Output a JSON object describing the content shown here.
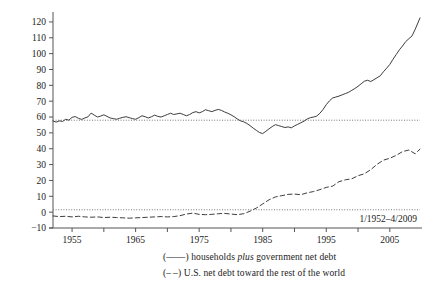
{
  "chart_data": {
    "type": "line",
    "title": "",
    "xlabel": "",
    "ylabel": "",
    "xlim": [
      1952.0,
      2009.75
    ],
    "ylim": [
      -10,
      125
    ],
    "ytick_labels": [
      "120",
      "110",
      "100",
      "90",
      "80",
      "70",
      "60",
      "50",
      "40",
      "30",
      "20",
      "10",
      "0",
      "-10"
    ],
    "ytick_values": [
      120,
      110,
      100,
      90,
      80,
      70,
      60,
      50,
      40,
      30,
      20,
      10,
      0,
      -10
    ],
    "xtick_labels": [
      "1955",
      "1965",
      "1975",
      "1985",
      "1995",
      "2005"
    ],
    "xtick_values": [
      1955,
      1965,
      1975,
      1985,
      1995,
      2005
    ],
    "xminor_ticks": [
      1960,
      1970,
      1980,
      1990,
      2000
    ],
    "grid": false,
    "legend_position": "below-right",
    "reference_lines": [
      {
        "name": "households-plus-government-mean",
        "value": 58,
        "style": "dotted"
      },
      {
        "name": "us-net-debt-mean",
        "value": 1.5,
        "style": "dotted"
      }
    ],
    "annotation": "1/1952–4/2009",
    "series": [
      {
        "name": "households plus government net debt",
        "style": "solid",
        "color": "#333333",
        "x": [
          1952.0,
          1952.5,
          1953.0,
          1953.5,
          1954.0,
          1954.5,
          1955.0,
          1955.5,
          1956.0,
          1956.5,
          1957.0,
          1957.5,
          1958.0,
          1958.5,
          1959.0,
          1959.5,
          1960.0,
          1960.5,
          1961.0,
          1961.5,
          1962.0,
          1962.5,
          1963.0,
          1963.5,
          1964.0,
          1964.5,
          1965.0,
          1965.5,
          1966.0,
          1966.5,
          1967.0,
          1967.5,
          1968.0,
          1968.5,
          1969.0,
          1969.5,
          1970.0,
          1970.5,
          1971.0,
          1971.5,
          1972.0,
          1972.5,
          1973.0,
          1973.5,
          1974.0,
          1974.5,
          1975.0,
          1975.5,
          1976.0,
          1976.5,
          1977.0,
          1977.5,
          1978.0,
          1978.5,
          1979.0,
          1979.5,
          1980.0,
          1980.5,
          1981.0,
          1981.5,
          1982.0,
          1982.5,
          1983.0,
          1983.5,
          1984.0,
          1984.5,
          1985.0,
          1985.5,
          1986.0,
          1986.5,
          1987.0,
          1987.5,
          1988.0,
          1988.5,
          1989.0,
          1989.5,
          1990.0,
          1990.5,
          1991.0,
          1991.5,
          1992.0,
          1992.5,
          1993.0,
          1993.5,
          1994.0,
          1994.5,
          1995.0,
          1995.5,
          1996.0,
          1996.5,
          1997.0,
          1997.5,
          1998.0,
          1998.5,
          1999.0,
          1999.5,
          2000.0,
          2000.5,
          2001.0,
          2001.5,
          2002.0,
          2002.5,
          2003.0,
          2003.5,
          2004.0,
          2004.5,
          2005.0,
          2005.5,
          2006.0,
          2006.5,
          2007.0,
          2007.5,
          2008.0,
          2008.5,
          2009.0,
          2009.75
        ],
        "y": [
          57.5,
          56.8,
          57.6,
          57.2,
          58.6,
          58.0,
          59.8,
          60.3,
          59.2,
          58.5,
          59.4,
          60.1,
          62.5,
          61.2,
          60.0,
          60.6,
          61.4,
          60.4,
          59.4,
          59.0,
          58.6,
          59.2,
          59.8,
          60.2,
          59.6,
          59.0,
          58.6,
          59.6,
          60.8,
          60.2,
          59.4,
          60.2,
          61.2,
          60.4,
          60.0,
          60.8,
          61.6,
          62.4,
          61.6,
          62.0,
          62.4,
          61.6,
          60.8,
          61.6,
          62.8,
          63.4,
          62.6,
          63.4,
          64.6,
          64.0,
          63.4,
          64.2,
          64.8,
          64.2,
          63.2,
          62.4,
          61.4,
          60.2,
          58.8,
          57.6,
          57.0,
          56.0,
          54.6,
          53.0,
          51.6,
          50.2,
          49.6,
          51.0,
          52.6,
          54.0,
          55.2,
          54.6,
          54.0,
          53.4,
          53.8,
          53.2,
          54.4,
          55.4,
          56.4,
          57.4,
          58.8,
          59.6,
          60.0,
          60.6,
          62.4,
          64.8,
          67.8,
          70.2,
          72.0,
          72.6,
          73.2,
          74.0,
          74.8,
          75.6,
          76.8,
          78.0,
          79.4,
          81.0,
          82.6,
          83.2,
          82.4,
          83.6,
          84.8,
          86.0,
          88.6,
          90.8,
          93.2,
          96.4,
          99.4,
          102.4,
          104.8,
          107.6,
          109.4,
          111.2,
          115.4,
          122.5
        ]
      },
      {
        "name": "U.S. net debt toward the rest of the world",
        "style": "dashed",
        "color": "#333333",
        "x": [
          1952.0,
          1953.0,
          1954.0,
          1955.0,
          1956.0,
          1957.0,
          1958.0,
          1959.0,
          1960.0,
          1961.0,
          1962.0,
          1963.0,
          1964.0,
          1965.0,
          1966.0,
          1967.0,
          1968.0,
          1969.0,
          1970.0,
          1971.0,
          1972.0,
          1973.0,
          1974.0,
          1975.0,
          1976.0,
          1977.0,
          1978.0,
          1979.0,
          1980.0,
          1981.0,
          1982.0,
          1983.0,
          1984.0,
          1985.0,
          1986.0,
          1987.0,
          1988.0,
          1989.0,
          1990.0,
          1991.0,
          1992.0,
          1993.0,
          1994.0,
          1995.0,
          1996.0,
          1997.0,
          1998.0,
          1999.0,
          2000.0,
          2001.0,
          2002.0,
          2003.0,
          2004.0,
          2005.0,
          2006.0,
          2007.0,
          2008.0,
          2009.0,
          2009.75
        ],
        "y": [
          -2.4,
          -2.8,
          -2.6,
          -3.0,
          -2.6,
          -3.0,
          -3.2,
          -3.0,
          -3.4,
          -3.2,
          -3.4,
          -3.6,
          -3.8,
          -3.6,
          -3.4,
          -3.2,
          -3.0,
          -2.8,
          -3.0,
          -2.8,
          -2.2,
          -1.2,
          -0.6,
          -1.4,
          -1.6,
          -1.4,
          -1.0,
          -0.8,
          -1.2,
          -1.6,
          -1.0,
          0.6,
          2.6,
          5.2,
          7.8,
          9.6,
          10.4,
          11.2,
          11.4,
          11.0,
          12.2,
          13.0,
          14.2,
          15.6,
          16.4,
          19.2,
          20.4,
          21.0,
          23.0,
          24.2,
          26.8,
          30.2,
          32.8,
          34.0,
          35.8,
          38.2,
          39.2,
          36.8,
          39.8
        ]
      }
    ]
  },
  "legend": {
    "items": [
      {
        "marker": "(——)",
        "pre": "households ",
        "em": "plus",
        "post": " government net debt"
      },
      {
        "marker": "(– –)",
        "pre": "U.S. net debt toward the rest of the world",
        "em": "",
        "post": ""
      }
    ]
  },
  "colors": {
    "line": "#333333",
    "axis": "#555555",
    "background": "#ffffff",
    "text": "#222222"
  }
}
